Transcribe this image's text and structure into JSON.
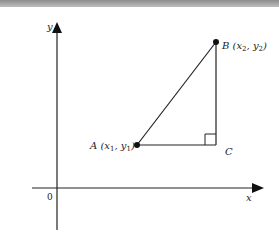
{
  "diagram": {
    "title": "",
    "axes": {
      "x_label": "x",
      "y_label": "y",
      "origin_label": "0"
    },
    "points": {
      "A": {
        "label": "A (x₁, y₁)",
        "name": "A",
        "sub": "1"
      },
      "B": {
        "label": "B (x₂, y₂)",
        "name": "B",
        "sub": "2"
      },
      "C": {
        "label": "C"
      }
    },
    "shapes": [
      "right triangle ABC with right angle at C",
      "segment AB (hypotenuse)",
      "segment AC (horizontal)",
      "segment BC (vertical)"
    ],
    "colors": {
      "line": "#222222",
      "point": "#111111",
      "band": "#9e9e9e"
    }
  }
}
